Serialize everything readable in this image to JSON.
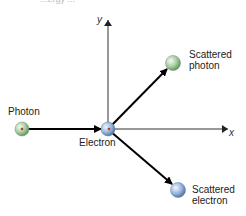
{
  "diagram": {
    "title_fragment": "...ergy ... ",
    "axes": {
      "x_label": "x",
      "y_label": "y"
    },
    "particles": {
      "photon": {
        "label": "Photon",
        "color": "#9fc79a"
      },
      "electron": {
        "label": "Electron",
        "color": "#8fb0d8"
      },
      "scattered_photon": {
        "label_line1": "Scattered",
        "label_line2": "photon",
        "color": "#9fc79a"
      },
      "scattered_electron": {
        "label_line1": "Scattered",
        "label_line2": "electron",
        "color": "#8fb0d8"
      }
    }
  }
}
